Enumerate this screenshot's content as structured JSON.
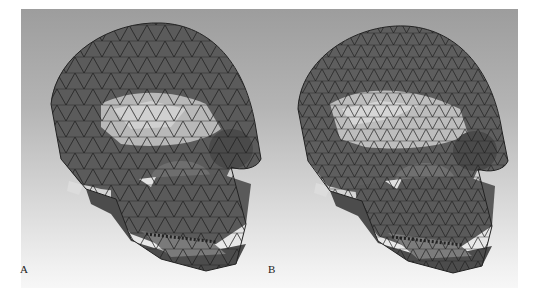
{
  "figure": {
    "type": "skull mesh comparison",
    "panels": [
      {
        "label": "A",
        "description": "Triangulated wireframe skull mesh, coarser density"
      },
      {
        "label": "B",
        "description": "Triangulated wireframe skull mesh, finer density"
      }
    ],
    "colors": {
      "background_top": "#9d9d9d",
      "background_bottom": "#f7f7f7",
      "mesh_dark": "#3a3a3a",
      "mesh_mid": "#6a6a6a",
      "mesh_light": "#bdbdbd",
      "edge": "#1e1e1e"
    }
  }
}
